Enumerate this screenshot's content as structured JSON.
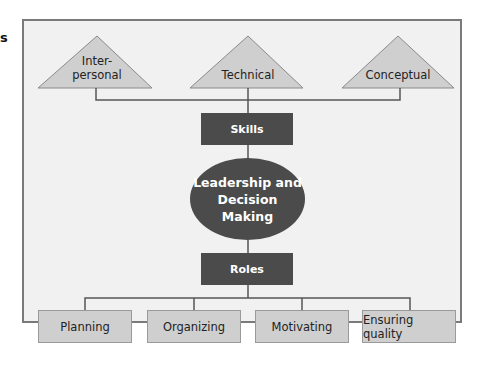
{
  "fragment_text": "s",
  "skills_types": [
    {
      "label": "Inter-\npersonal"
    },
    {
      "label": "Technical"
    },
    {
      "label": "Conceptual"
    }
  ],
  "skills_box": "Skills",
  "center": "Leadership and Decision Making",
  "roles_box": "Roles",
  "roles": [
    {
      "label": "Planning"
    },
    {
      "label": "Organizing"
    },
    {
      "label": "Motivating"
    },
    {
      "label": "Ensuring quality"
    }
  ]
}
